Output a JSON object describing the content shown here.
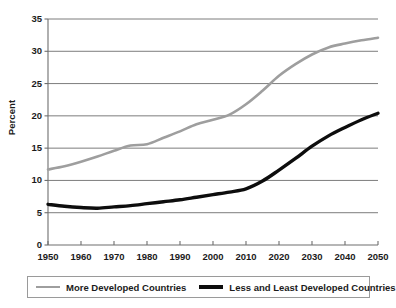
{
  "chart_data": {
    "type": "line",
    "title": "",
    "subtitle": "",
    "xlabel": "",
    "ylabel": "Percent",
    "xlim": [
      1950,
      2050
    ],
    "ylim": [
      0,
      35
    ],
    "grid": "horizontal",
    "legend_position": "bottom",
    "x_ticks": [
      "1950",
      "1960",
      "1970",
      "1980",
      "1990",
      "2000",
      "2010",
      "2020",
      "2030",
      "2040",
      "2050"
    ],
    "y_ticks": [
      "0",
      "5",
      "10",
      "15",
      "20",
      "25",
      "30",
      "35"
    ],
    "x": [
      1950,
      1955,
      1960,
      1965,
      1970,
      1975,
      1980,
      1985,
      1990,
      1995,
      2000,
      2005,
      2010,
      2015,
      2020,
      2025,
      2030,
      2035,
      2040,
      2045,
      2050
    ],
    "series": [
      {
        "name": "More Developed Countries",
        "color": "#9e9e9e",
        "width": 2.6,
        "values": [
          11.7,
          12.2,
          12.9,
          13.7,
          14.6,
          15.4,
          15.6,
          16.6,
          17.6,
          18.7,
          19.4,
          20.2,
          21.8,
          23.9,
          26.2,
          28.0,
          29.5,
          30.6,
          31.2,
          31.7,
          32.1
        ]
      },
      {
        "name": "Less and Least Developed Countries",
        "color": "#0d0d0d",
        "width": 3.4,
        "values": [
          6.3,
          6.0,
          5.8,
          5.7,
          5.9,
          6.1,
          6.4,
          6.7,
          7.0,
          7.4,
          7.8,
          8.2,
          8.7,
          9.9,
          11.6,
          13.4,
          15.3,
          16.9,
          18.2,
          19.4,
          20.4
        ]
      }
    ],
    "legend": [
      {
        "label": "More Developed Countries",
        "marker": "gray-line-swatch"
      },
      {
        "label": "Less and Least Developed Countries",
        "marker": "black-line-swatch"
      }
    ]
  }
}
